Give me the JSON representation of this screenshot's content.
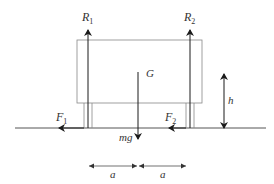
{
  "diagram": {
    "colors": {
      "line": "#555555",
      "arrow": "#1a1a1a",
      "box": "#888888",
      "text": "#333333",
      "background": "#ffffff"
    },
    "labels": {
      "R1": {
        "main": "R",
        "sub": "1"
      },
      "R2": {
        "main": "R",
        "sub": "2"
      },
      "G": "G",
      "h": "h",
      "F1": {
        "main": "F",
        "sub": "1"
      },
      "F2": {
        "main": "F",
        "sub": "2"
      },
      "mg": "mg",
      "a_left": "a",
      "a_right": "a"
    },
    "elements": {
      "body": "rectangular body",
      "ground": "ground line",
      "reaction_arrows": [
        "R1 upward at left support",
        "R2 upward at right support"
      ],
      "friction_arrows": [
        "F1 leftward at left support",
        "F2 leftward at right support"
      ],
      "weight_arrow": "mg downward from G",
      "height_dimension": "h from ground to centre of mass level",
      "span_dimensions": [
        "a",
        "a"
      ]
    }
  }
}
